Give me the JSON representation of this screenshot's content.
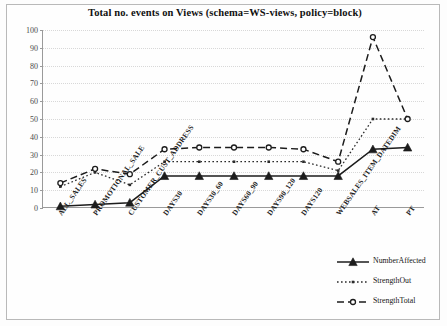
{
  "chart_data": {
    "type": "line",
    "title": "Total no. events on Views (schema=WS-views, policy=block)",
    "xlabel": "",
    "ylabel": "",
    "ylim": [
      0,
      100
    ],
    "yticks": [
      0,
      10,
      20,
      30,
      40,
      50,
      60,
      70,
      80,
      90,
      100
    ],
    "grid": true,
    "legend_position": "bottom-right",
    "categories": [
      "ALL_SALES",
      "PROMOTIONAL_SALE",
      "CUSTOMER_CUST_ADDRESS",
      "DAYS30",
      "DAYS30_60",
      "DAYS60_90",
      "DAYS90_120",
      "DAYS120",
      "WEBSALES_ITEM_DATEDIM",
      "AT",
      "PT"
    ],
    "series": [
      {
        "name": "NumberAffected",
        "style": "solid",
        "marker": "filled-triangle",
        "color": "#1c1c1c",
        "values": [
          1,
          2,
          3,
          18,
          18,
          18,
          18,
          18,
          18,
          33,
          34
        ]
      },
      {
        "name": "StrengthOut",
        "style": "dotted",
        "marker": "small-square",
        "color": "#2b2b2b",
        "values": [
          12,
          20,
          13,
          26,
          26,
          26,
          26,
          26,
          21,
          50,
          50
        ]
      },
      {
        "name": "StrengthTotal",
        "style": "dashed",
        "marker": "open-circle",
        "color": "#1c1c1c",
        "values": [
          14,
          22,
          19,
          33,
          34,
          34,
          34,
          33,
          26,
          96,
          50
        ]
      }
    ]
  },
  "legend": {
    "items": [
      {
        "label": "NumberAffected"
      },
      {
        "label": "StrengthOut"
      },
      {
        "label": "StrengthTotal"
      }
    ]
  }
}
